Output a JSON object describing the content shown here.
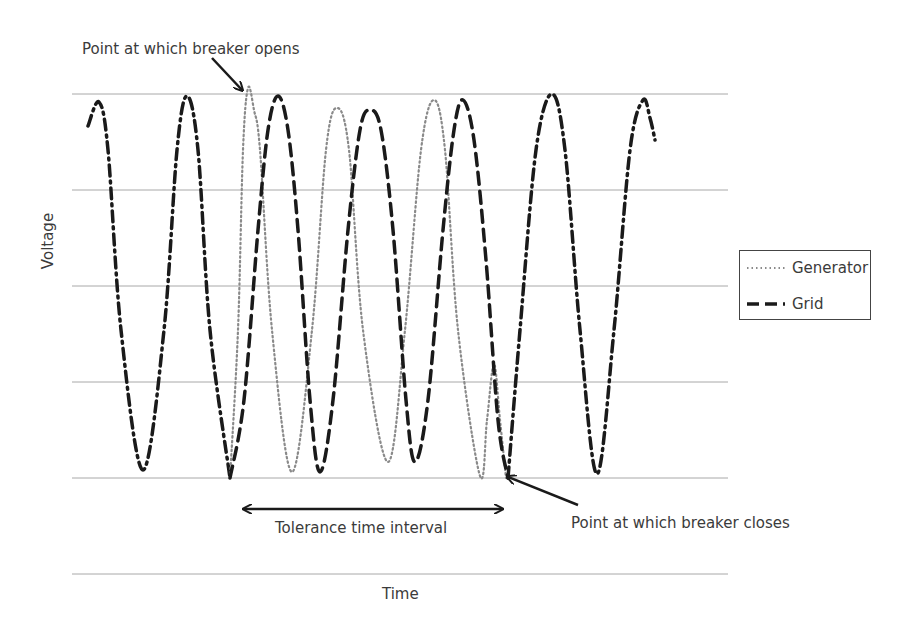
{
  "chart_data": {
    "type": "line",
    "title": "",
    "xlabel": "Time",
    "ylabel": "Voltage",
    "grid": true,
    "legend_position": "right",
    "legend": [
      {
        "name": "Generator",
        "style": "dotted",
        "color": "#8a8a8a"
      },
      {
        "name": "Grid",
        "style": "dashed",
        "color": "#1a1a1a"
      }
    ],
    "annotations": [
      {
        "text": "Point at which breaker opens",
        "x": 248,
        "y": 88
      },
      {
        "text": "Tolerance time interval",
        "x_start": 242,
        "x_end": 505
      },
      {
        "text": "Point at which breaker closes",
        "x": 506,
        "y": 478
      }
    ],
    "series": [
      {
        "name": "Combined (Generator = Grid, before opening)",
        "style": "dashdot",
        "points": [
          [
            88,
            126
          ],
          [
            99,
            102
          ],
          [
            108,
            150
          ],
          [
            121,
            330
          ],
          [
            143,
            470
          ],
          [
            164,
            330
          ],
          [
            177,
            150
          ],
          [
            187,
            96
          ],
          [
            198,
            150
          ],
          [
            210,
            330
          ],
          [
            230,
            478
          ]
        ]
      },
      {
        "name": "Generator",
        "style": "dotted",
        "points": [
          [
            230,
            478
          ],
          [
            238,
            330
          ],
          [
            243,
            150
          ],
          [
            248,
            88
          ],
          [
            254,
            110
          ],
          [
            260,
            150
          ],
          [
            272,
            330
          ],
          [
            292,
            472
          ],
          [
            312,
            330
          ],
          [
            326,
            150
          ],
          [
            337,
            108
          ],
          [
            349,
            150
          ],
          [
            363,
            330
          ],
          [
            388,
            462
          ],
          [
            405,
            330
          ],
          [
            421,
            150
          ],
          [
            434,
            100
          ],
          [
            445,
            150
          ],
          [
            458,
            330
          ],
          [
            480,
            476
          ],
          [
            487,
            420
          ],
          [
            494,
            364
          ],
          [
            500,
            420
          ],
          [
            506,
            478
          ]
        ]
      },
      {
        "name": "Grid",
        "style": "dashed",
        "points": [
          [
            230,
            478
          ],
          [
            244,
            400
          ],
          [
            258,
            230
          ],
          [
            268,
            130
          ],
          [
            278,
            96
          ],
          [
            288,
            130
          ],
          [
            298,
            230
          ],
          [
            310,
            400
          ],
          [
            320,
            472
          ],
          [
            333,
            400
          ],
          [
            348,
            230
          ],
          [
            360,
            130
          ],
          [
            370,
            110
          ],
          [
            381,
            130
          ],
          [
            393,
            230
          ],
          [
            406,
            400
          ],
          [
            415,
            462
          ],
          [
            428,
            400
          ],
          [
            443,
            230
          ],
          [
            454,
            130
          ],
          [
            463,
            100
          ],
          [
            474,
            140
          ],
          [
            486,
            260
          ],
          [
            498,
            420
          ],
          [
            508,
            478
          ]
        ]
      },
      {
        "name": "Combined (Generator = Grid, after closing)",
        "style": "dashdot",
        "points": [
          [
            508,
            478
          ],
          [
            520,
            330
          ],
          [
            536,
            150
          ],
          [
            552,
            94
          ],
          [
            565,
            150
          ],
          [
            580,
            330
          ],
          [
            597,
            474
          ],
          [
            614,
            330
          ],
          [
            630,
            150
          ],
          [
            643,
            100
          ],
          [
            650,
            118
          ],
          [
            655,
            140
          ]
        ]
      }
    ],
    "gridlines_y": [
      94,
      190,
      286,
      382,
      478,
      574
    ],
    "plot_x_range": [
      72,
      728
    ]
  },
  "labels": {
    "opens": "Point at which breaker opens",
    "closes": "Point at which breaker closes",
    "tolerance": "Tolerance time interval",
    "xlabel": "Time",
    "ylabel": "Voltage"
  },
  "legend": {
    "generator": "Generator",
    "grid": "Grid"
  }
}
